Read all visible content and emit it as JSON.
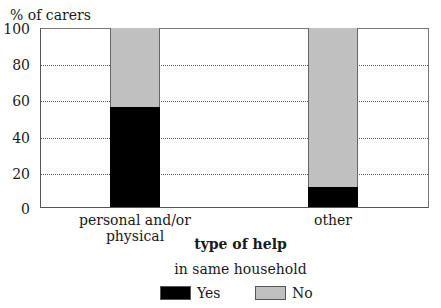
{
  "chart_data": {
    "type": "bar",
    "stacked": true,
    "title": "",
    "ylabel": "% of carers",
    "xlabel": "type of help",
    "ylim": [
      0,
      100
    ],
    "yticks": [
      0,
      20,
      40,
      60,
      80,
      100
    ],
    "grid": "horizontal dotted",
    "categories": [
      "personal and/or physical",
      "other"
    ],
    "series": [
      {
        "name": "Yes",
        "color": "#000000",
        "values": [
          56,
          11
        ]
      },
      {
        "name": "No",
        "color": "#c0c0c0",
        "values": [
          44,
          89
        ]
      }
    ],
    "legend": {
      "title": "in same household",
      "position": "bottom",
      "entries": [
        "Yes",
        "No"
      ]
    }
  },
  "labels": {
    "ylabel": "% of carers",
    "xtitle": "type of help",
    "legend_title": "in same household",
    "yes": "Yes",
    "no": "No",
    "cat0": "personal and/or physical",
    "cat1": "other",
    "t0": "0",
    "t20": "20",
    "t40": "40",
    "t60": "60",
    "t80": "80",
    "t100": "100"
  }
}
